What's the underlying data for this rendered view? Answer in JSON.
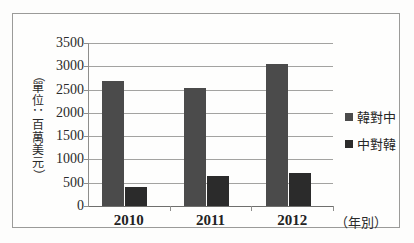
{
  "chart_data": {
    "type": "bar",
    "title": "",
    "categories": [
      "2010",
      "2011",
      "2012"
    ],
    "series": [
      {
        "name": "韓對中",
        "values": [
          2680,
          2530,
          3050
        ],
        "color": "#4b4b4b"
      },
      {
        "name": "中對韓",
        "values": [
          410,
          640,
          710
        ],
        "color": "#2b2b2b"
      }
    ],
    "xlabel": "（年別）",
    "ylabel": "（單位：百萬美元）",
    "ylim": [
      0,
      3500
    ],
    "ytick_labels": [
      "3500",
      "3000",
      "2500",
      "2000",
      "1500",
      "1000",
      "500",
      "0"
    ],
    "ytick_values": [
      3500,
      3000,
      2500,
      2000,
      1500,
      1000,
      500,
      0
    ],
    "grid": true,
    "legend_position": "right"
  },
  "yaxis_title_chars": [
    "（",
    "單",
    "位",
    "：",
    "百",
    "萬",
    "美",
    "元",
    "）"
  ]
}
